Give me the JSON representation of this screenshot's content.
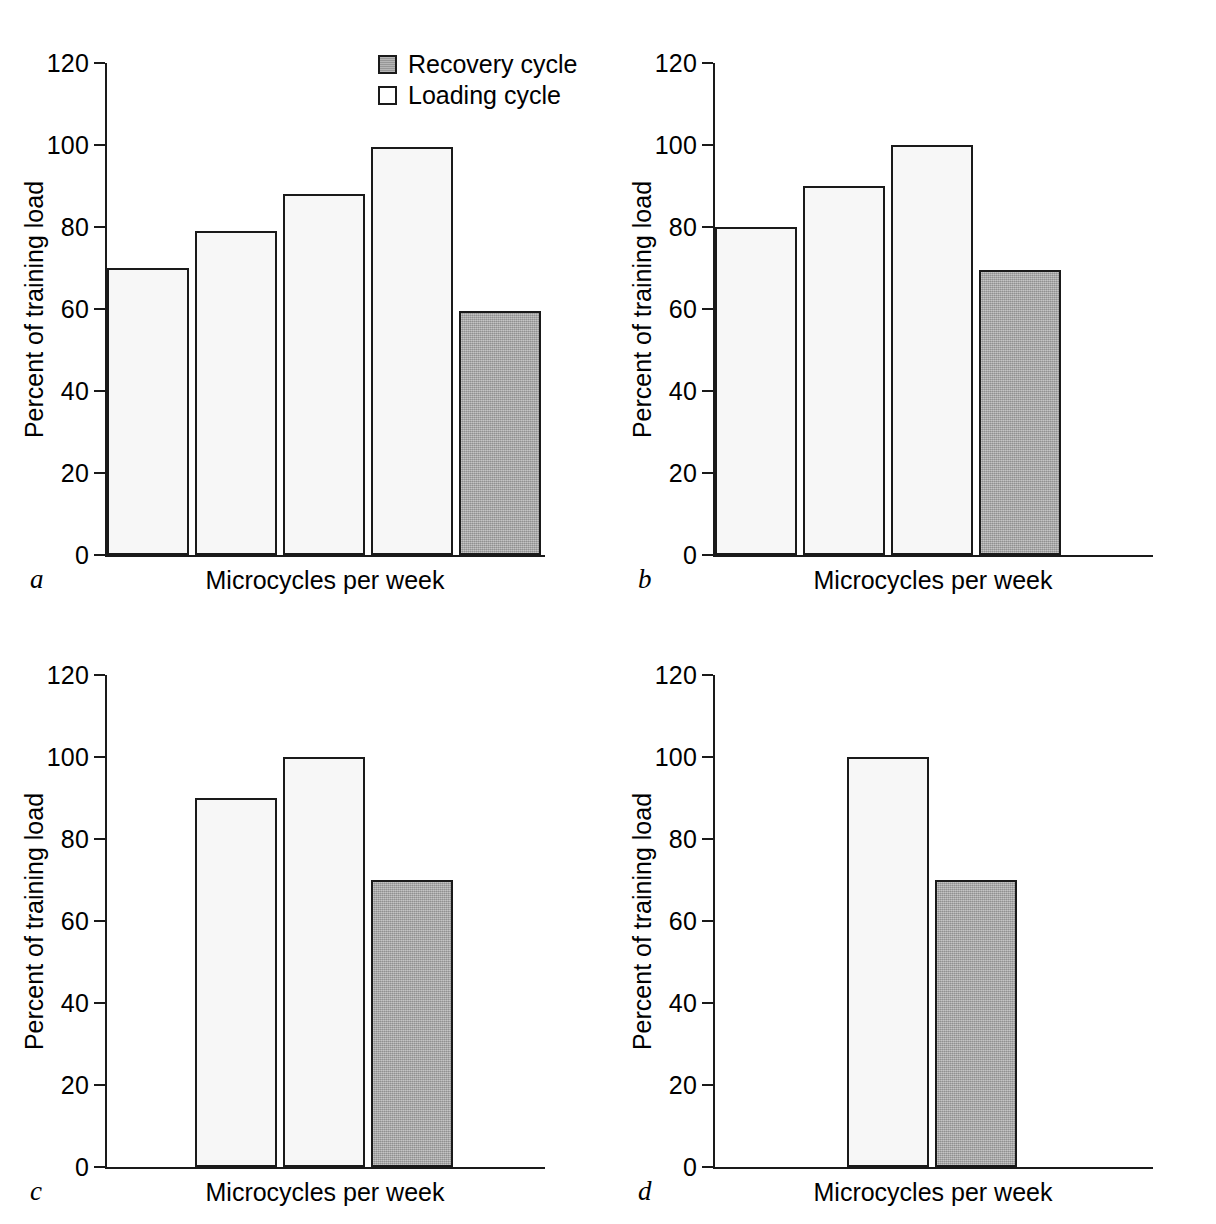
{
  "figure": {
    "ylabel": "Percent of training load",
    "xlabel": "Microcycles per week",
    "y_ticks": [
      "0",
      "20",
      "40",
      "60",
      "80",
      "100",
      "120"
    ],
    "legend": {
      "recovery_label": "Recovery cycle",
      "loading_label": "Loading cycle"
    },
    "colors": {
      "loading_fill": "#f7f7f7",
      "recovery_fill": "#aeaeae",
      "stroke": "#1a1a1a",
      "background": "#ffffff"
    }
  },
  "panels": [
    {
      "letter": "a",
      "letter_name": "panel-letter-a"
    },
    {
      "letter": "b",
      "letter_name": "panel-letter-b"
    },
    {
      "letter": "c",
      "letter_name": "panel-letter-c"
    },
    {
      "letter": "d",
      "letter_name": "panel-letter-d"
    }
  ],
  "chart_data": [
    {
      "type": "bar",
      "panel": "a",
      "title": "",
      "xlabel": "Microcycles per week",
      "ylabel": "Percent of training load",
      "ylim": [
        0,
        120
      ],
      "yticks": [
        0,
        20,
        40,
        60,
        80,
        100,
        120
      ],
      "grid": false,
      "legend_position": "top-right",
      "categories": [
        "1",
        "2",
        "3",
        "4",
        "5"
      ],
      "values": [
        70,
        79,
        88,
        99.5,
        59.5
      ],
      "bar_types": [
        "loading",
        "loading",
        "loading",
        "loading",
        "recovery"
      ],
      "leading_gap_slots": 0,
      "trailing_gap_slots": 0,
      "slots": 5
    },
    {
      "type": "bar",
      "panel": "b",
      "title": "",
      "xlabel": "Microcycles per week",
      "ylabel": "Percent of training load",
      "ylim": [
        0,
        120
      ],
      "yticks": [
        0,
        20,
        40,
        60,
        80,
        100,
        120
      ],
      "grid": false,
      "legend_position": "none",
      "categories": [
        "1",
        "2",
        "3",
        "4"
      ],
      "values": [
        80,
        90,
        100,
        69.5
      ],
      "bar_types": [
        "loading",
        "loading",
        "loading",
        "recovery"
      ],
      "leading_gap_slots": 0,
      "trailing_gap_slots": 1,
      "slots": 5
    },
    {
      "type": "bar",
      "panel": "c",
      "title": "",
      "xlabel": "Microcycles per week",
      "ylabel": "Percent of training load",
      "ylim": [
        0,
        120
      ],
      "yticks": [
        0,
        20,
        40,
        60,
        80,
        100,
        120
      ],
      "grid": false,
      "legend_position": "none",
      "categories": [
        "1",
        "2",
        "3"
      ],
      "values": [
        90,
        100,
        70
      ],
      "bar_types": [
        "loading",
        "loading",
        "recovery"
      ],
      "leading_gap_slots": 1,
      "trailing_gap_slots": 1,
      "slots": 5
    },
    {
      "type": "bar",
      "panel": "d",
      "title": "",
      "xlabel": "Microcycles per week",
      "ylabel": "Percent of training load",
      "ylim": [
        0,
        120
      ],
      "yticks": [
        0,
        20,
        40,
        60,
        80,
        100,
        120
      ],
      "grid": false,
      "legend_position": "none",
      "categories": [
        "1",
        "2"
      ],
      "values": [
        100,
        70
      ],
      "bar_types": [
        "loading",
        "recovery"
      ],
      "leading_gap_slots": 1.5,
      "trailing_gap_slots": 1.5,
      "slots": 5
    }
  ]
}
